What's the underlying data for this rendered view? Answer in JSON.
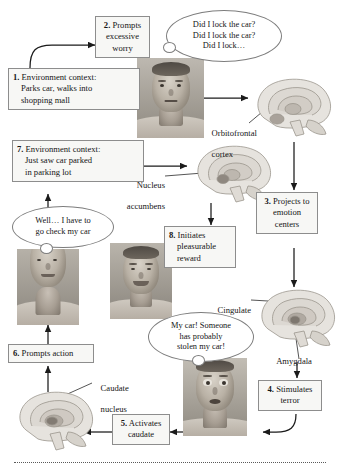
{
  "figure": {
    "accent_color": "#f7f7f5",
    "border_color": "#8d8d8d",
    "text_color": "#151515"
  },
  "steps": [
    {
      "id": "step-1",
      "number": "1.",
      "lines": [
        "Environment context:",
        "Parks car, walks into",
        "shopping mall"
      ]
    },
    {
      "id": "step-2",
      "number": "2.",
      "lines": [
        "Prompts",
        "excessive",
        "worry"
      ]
    },
    {
      "id": "step-3",
      "number": "3.",
      "lines": [
        "Projects to",
        "emotion",
        "centers"
      ]
    },
    {
      "id": "step-4",
      "number": "4.",
      "lines": [
        "Stimulates",
        "terror"
      ]
    },
    {
      "id": "step-5",
      "number": "5.",
      "lines": [
        "Activates",
        "caudate"
      ]
    },
    {
      "id": "step-6",
      "number": "6.",
      "lines": [
        "Prompts action"
      ]
    },
    {
      "id": "step-7",
      "number": "7.",
      "lines": [
        "Environment context:",
        "Just saw car parked",
        "in parking lot"
      ]
    },
    {
      "id": "step-8",
      "number": "8.",
      "lines": [
        "Initiates",
        "pleasurable",
        "reward"
      ]
    }
  ],
  "thoughts": [
    {
      "id": "thought-worry",
      "lines": [
        "Did I lock the car?",
        "Did I lock the car?",
        "Did I lock…"
      ]
    },
    {
      "id": "thought-check-car",
      "lines": [
        "Well… I have to",
        "go check my car"
      ]
    },
    {
      "id": "thought-stolen-car",
      "lines": [
        "My car! Someone",
        "has probably",
        "stolen my car!"
      ]
    }
  ],
  "anatomy_labels": [
    {
      "id": "label-orbitofrontal",
      "lines": [
        "Orbitofrontal",
        "cortex"
      ]
    },
    {
      "id": "label-nucleus-accumbens",
      "lines": [
        "Nucleus",
        "accumbens"
      ]
    },
    {
      "id": "label-cingulate",
      "lines": [
        "Cingulate",
        "cortex"
      ]
    },
    {
      "id": "label-amygdala",
      "lines": [
        "Amygdala"
      ]
    },
    {
      "id": "label-caudate",
      "lines": [
        "Caudate",
        "nucleus"
      ]
    }
  ],
  "photos": [
    {
      "id": "photo-worried-man",
      "caption": "worried man with neutral anxious face"
    },
    {
      "id": "photo-smiling-man",
      "caption": "smiling relieved man"
    },
    {
      "id": "photo-walking-man",
      "caption": "man walking, lower face and neck"
    },
    {
      "id": "photo-terrified-man",
      "caption": "terrified man with wide eyes"
    }
  ],
  "brains": [
    {
      "id": "brain-orbitofrontal",
      "caption": "midsagittal brain, orbitofrontal cortex highlighted"
    },
    {
      "id": "brain-nucleus-accumbens",
      "caption": "midsagittal brain, nucleus accumbens highlighted"
    },
    {
      "id": "brain-cingulate-amygdala",
      "caption": "midsagittal brain, cingulate cortex and amygdala highlighted"
    },
    {
      "id": "brain-caudate",
      "caption": "midsagittal brain, caudate nucleus highlighted"
    }
  ]
}
